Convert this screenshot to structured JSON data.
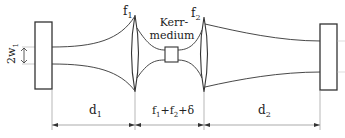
{
  "diagram": {
    "type": "optical cavity schematic",
    "labels": {
      "lens1": "f",
      "lens1_sub": "1",
      "lens2": "f",
      "lens2_sub": "2",
      "kerr_line1": "Kerr-",
      "kerr_line2": "medium",
      "waist": "2w",
      "waist_sub": "1",
      "d1": "d",
      "d1_sub": "1",
      "middle_f1": "f",
      "middle_f1_sub": "1",
      "middle_plus1": "+f",
      "middle_f2_sub": "2",
      "middle_delta": "+δ",
      "d2": "d",
      "d2_sub": "2"
    },
    "components": [
      {
        "name": "left-mirror"
      },
      {
        "name": "lens-f1"
      },
      {
        "name": "kerr-medium"
      },
      {
        "name": "lens-f2"
      },
      {
        "name": "right-mirror"
      }
    ],
    "dimensions": [
      "d1",
      "f1+f2+δ",
      "d2"
    ],
    "colors": {
      "line": "#333333",
      "dimension": "#888888"
    }
  }
}
